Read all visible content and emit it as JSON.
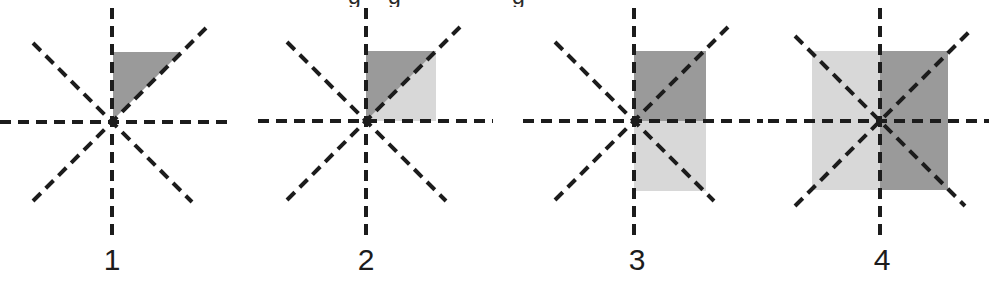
{
  "page": {
    "background_color": "#ffffff",
    "width": 989,
    "height": 284,
    "clipped_header_fragment": "g g    g"
  },
  "palette": {
    "dark_gray": "#9a9a9a",
    "light_gray": "#d8d8d8",
    "line_color": "#1c1c1c",
    "caption_color": "#1c1c1c",
    "background": "#ffffff"
  },
  "axes_style": {
    "dash_on": 11,
    "dash_off": 7,
    "stroke_width": 4,
    "ray_count": 8,
    "description": "four dashed lines through origin: horizontal, vertical, diagonal up-right, diagonal up-left"
  },
  "figures": [
    {
      "id": "figure-1",
      "caption": "1",
      "caption_center_x": 112,
      "origin": {
        "x": 112,
        "y": 122
      },
      "shaded_description": "dark gray right triangle occupying the upper half of quadrant I, between the vertical axis and the 45 degree diagonal",
      "regions": [
        {
          "name": "upper-octant-triangle",
          "fill": "dark_gray",
          "shape": "triangle"
        }
      ],
      "shade_count": 1
    },
    {
      "id": "figure-2",
      "caption": "2",
      "caption_center_x": 366,
      "origin": {
        "x": 366,
        "y": 121
      },
      "shaded_description": "full square in quadrant I split along the 45 degree diagonal; dark gray triangle above the diagonal, light gray triangle below it",
      "regions": [
        {
          "name": "upper-octant-triangle",
          "fill": "dark_gray",
          "shape": "triangle"
        },
        {
          "name": "lower-octant-triangle",
          "fill": "light_gray",
          "shape": "triangle"
        }
      ],
      "shade_count": 2
    },
    {
      "id": "figure-3",
      "caption": "3",
      "caption_center_x": 637,
      "origin": {
        "x": 634,
        "y": 121
      },
      "shaded_description": "tall rectangle right of the vertical axis spanning quadrants I and IV; dark gray above the horizontal axis, light gray below it",
      "regions": [
        {
          "name": "quadrant-I-rect",
          "fill": "dark_gray",
          "shape": "rectangle"
        },
        {
          "name": "quadrant-IV-rect",
          "fill": "light_gray",
          "shape": "rectangle"
        }
      ],
      "shade_count": 2
    },
    {
      "id": "figure-4",
      "caption": "4",
      "caption_center_x": 882,
      "origin": {
        "x": 880,
        "y": 121
      },
      "shaded_description": "large square centered on the origin; light gray left half, dark gray right half, crossed by all four dashed lines",
      "regions": [
        {
          "name": "left-half-square",
          "fill": "light_gray",
          "shape": "rectangle"
        },
        {
          "name": "right-half-square",
          "fill": "dark_gray",
          "shape": "rectangle"
        }
      ],
      "shade_count": 2
    }
  ]
}
